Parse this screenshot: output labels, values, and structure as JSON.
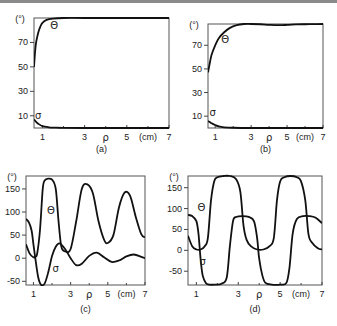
{
  "chart_data": [
    {
      "type": "line",
      "panel_label": "(a)",
      "ylabel": "(°)",
      "xlabel_symbol": "ρ",
      "xunit": "(cm)",
      "xlim": [
        0.6,
        7
      ],
      "ylim": [
        0,
        90
      ],
      "yticks": [
        10,
        30,
        50,
        70
      ],
      "xticks": [
        1,
        3,
        5,
        7
      ],
      "x_minor_ticks": [
        2,
        4,
        6
      ],
      "series": [
        {
          "name": "Θ",
          "x": [
            0.6,
            0.65,
            0.7,
            0.8,
            0.9,
            1.0,
            1.2,
            1.5,
            2.0,
            3.0,
            5.0,
            7.0
          ],
          "y": [
            50,
            62,
            70,
            78,
            83,
            86,
            88.5,
            89.5,
            90,
            90,
            90,
            90
          ]
        },
        {
          "name": "σ",
          "x": [
            0.6,
            0.7,
            0.8,
            1.0,
            1.3,
            1.6,
            2.0,
            3.0,
            5.0,
            7.0
          ],
          "y": [
            7,
            5,
            3.5,
            1.5,
            0.6,
            0.3,
            0.1,
            0,
            0,
            0
          ]
        }
      ],
      "annotations": [
        {
          "text": "Θ",
          "near": "top-left"
        },
        {
          "text": "σ",
          "near": "bottom-left"
        }
      ]
    },
    {
      "type": "line",
      "panel_label": "(b)",
      "ylabel": "(°)",
      "xlabel_symbol": "ρ",
      "xunit": "(cm)",
      "xlim": [
        0.6,
        7
      ],
      "ylim": [
        0,
        88
      ],
      "yticks": [
        10,
        30,
        50,
        70
      ],
      "xticks": [
        1,
        3,
        5,
        7
      ],
      "x_minor_ticks": [
        2,
        4,
        6
      ],
      "series": [
        {
          "name": "Θ",
          "x": [
            0.6,
            0.7,
            0.8,
            1.0,
            1.2,
            1.5,
            1.8,
            2.2,
            2.6,
            3.0,
            3.5,
            4.0,
            4.5,
            5.0,
            5.5,
            6.0,
            6.5,
            7.0
          ],
          "y": [
            47,
            55,
            62,
            70,
            76,
            81,
            84.5,
            87,
            88,
            88,
            87.8,
            87.3,
            87,
            87.2,
            87.6,
            87.8,
            87.9,
            88
          ]
        },
        {
          "name": "σ",
          "x": [
            0.6,
            0.7,
            0.8,
            1.0,
            1.2,
            1.5,
            2.0,
            3.0,
            5.0,
            7.0
          ],
          "y": [
            6,
            5,
            4,
            2.5,
            1.3,
            0.6,
            0.2,
            0,
            0,
            0
          ]
        }
      ],
      "annotations": [
        {
          "text": "Θ",
          "near": "top-left"
        },
        {
          "text": "σ",
          "near": "bottom-left"
        }
      ]
    },
    {
      "type": "line",
      "panel_label": "(c)",
      "ylabel": "(°)",
      "xlabel_symbol": "ρ",
      "xunit": "(cm)",
      "xlim": [
        0.6,
        7
      ],
      "ylim": [
        -58,
        178
      ],
      "yticks": [
        -50,
        0,
        50,
        100,
        150
      ],
      "xticks": [
        1,
        3,
        5,
        7
      ],
      "x_minor_ticks": [
        2,
        4,
        6
      ],
      "series": [
        {
          "name": "Θ",
          "x": [
            0.6,
            0.8,
            1.0,
            1.1,
            1.2,
            1.35,
            1.5,
            1.6,
            1.75,
            2.0,
            2.2,
            2.35,
            2.5,
            2.7,
            3.0,
            3.3,
            3.6,
            3.9,
            4.2,
            4.5,
            4.8,
            5.0,
            5.3,
            5.6,
            5.9,
            6.2,
            6.5,
            6.8,
            7.0
          ],
          "y": [
            30,
            10,
            2,
            3,
            10,
            60,
            150,
            168,
            172,
            170,
            150,
            80,
            25,
            15,
            20,
            80,
            150,
            160,
            140,
            80,
            40,
            33,
            50,
            110,
            142,
            135,
            90,
            52,
            45
          ]
        },
        {
          "name": "σ",
          "x": [
            0.6,
            0.75,
            0.9,
            1.0,
            1.1,
            1.25,
            1.4,
            1.6,
            1.8,
            2.0,
            2.2,
            2.4,
            2.7,
            3.0,
            3.3,
            3.6,
            4.0,
            4.4,
            4.8,
            5.2,
            5.6,
            6.0,
            6.4,
            6.8,
            7.0
          ],
          "y": [
            85,
            78,
            60,
            30,
            0,
            -40,
            -57,
            -55,
            -30,
            5,
            25,
            32,
            20,
            0,
            -15,
            -12,
            5,
            12,
            2,
            -8,
            -5,
            4,
            8,
            3,
            0
          ]
        }
      ],
      "annotations": [
        {
          "text": "Θ",
          "near": "upper-left"
        },
        {
          "text": "σ",
          "near": "lower-middle"
        }
      ]
    },
    {
      "type": "line",
      "panel_label": "(d)",
      "ylabel": "(°)",
      "xlabel_symbol": "ρ",
      "xunit": "(cm)",
      "xlim": [
        0.6,
        7
      ],
      "ylim": [
        -83,
        178
      ],
      "yticks": [
        -50,
        0,
        50,
        100,
        150
      ],
      "xticks": [
        1,
        3,
        5,
        7
      ],
      "x_minor_ticks": [
        2,
        4,
        6
      ],
      "series": [
        {
          "name": "Θ",
          "x": [
            0.6,
            0.8,
            1.0,
            1.2,
            1.4,
            1.55,
            1.7,
            1.85,
            2.0,
            2.3,
            2.6,
            2.9,
            3.1,
            3.25,
            3.4,
            3.6,
            3.9,
            4.2,
            4.5,
            4.7,
            4.85,
            5.0,
            5.2,
            5.5,
            5.8,
            6.0,
            6.2,
            6.35,
            6.5,
            6.8,
            7.0
          ],
          "y": [
            35,
            10,
            2,
            2,
            10,
            30,
            120,
            165,
            175,
            178,
            178,
            170,
            140,
            60,
            25,
            10,
            2,
            2,
            10,
            30,
            120,
            165,
            175,
            178,
            175,
            165,
            120,
            40,
            20,
            5,
            2
          ]
        },
        {
          "name": "σ",
          "x": [
            0.6,
            0.8,
            1.0,
            1.1,
            1.2,
            1.3,
            1.45,
            1.6,
            1.9,
            2.2,
            2.45,
            2.6,
            2.75,
            2.9,
            3.2,
            3.5,
            3.75,
            3.9,
            4.0,
            4.15,
            4.3,
            4.6,
            5.0,
            5.3,
            5.45,
            5.6,
            5.8,
            6.1,
            6.4,
            6.7,
            7.0
          ],
          "y": [
            85,
            82,
            70,
            40,
            -20,
            -60,
            -78,
            -82,
            -82,
            -80,
            -65,
            10,
            70,
            80,
            82,
            80,
            70,
            30,
            -20,
            -60,
            -78,
            -82,
            -82,
            -78,
            -40,
            40,
            75,
            82,
            82,
            78,
            65
          ]
        }
      ],
      "annotations": [
        {
          "text": "Θ",
          "near": "upper-left"
        },
        {
          "text": "σ",
          "near": "lower-left"
        }
      ]
    }
  ]
}
